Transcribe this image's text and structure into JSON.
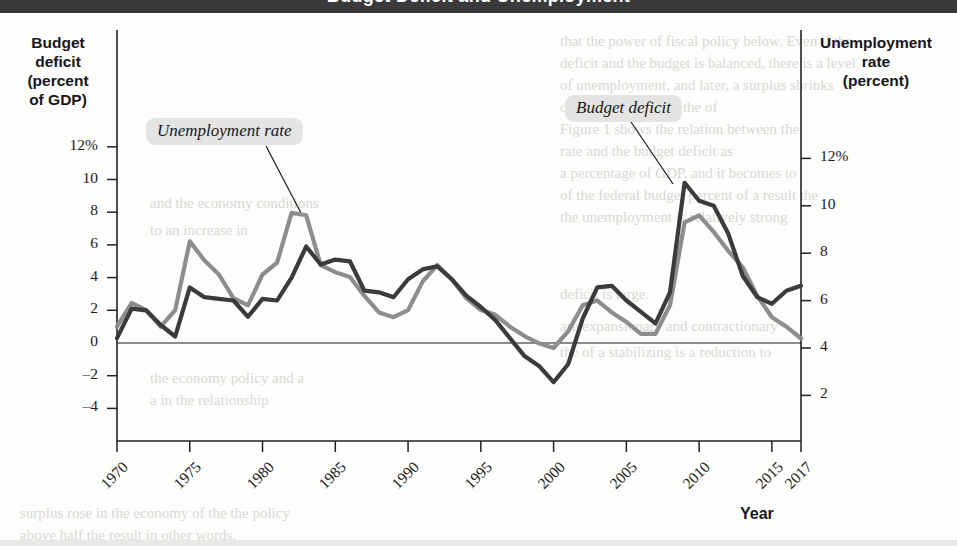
{
  "header": {
    "title": "Budget Deficit and Unemployment"
  },
  "axes": {
    "left_title_lines": [
      "Budget",
      "deficit",
      "(percent",
      "of GDP)"
    ],
    "right_title_lines": [
      "Unemployment",
      "rate",
      "(percent)"
    ],
    "x_title": "Year",
    "left_ticks": [
      "12%",
      "10",
      "8",
      "6",
      "4",
      "2",
      "0",
      "–2",
      "–4"
    ],
    "right_ticks": [
      "12%",
      "10",
      "8",
      "6",
      "4",
      "2"
    ],
    "x_ticks": [
      "1970",
      "1975",
      "1980",
      "1985",
      "1990",
      "1995",
      "2000",
      "2005",
      "2010",
      "2015",
      "2017"
    ]
  },
  "callouts": {
    "unemployment": "Unemployment rate",
    "budget_deficit": "Budget deficit"
  },
  "colors": {
    "unemployment_line": "#8d8d8d",
    "deficit_line": "#3b3b3d",
    "axis": "#222222",
    "callout_bg": "#e4e4e2",
    "header_bar": "#3a3a3c"
  },
  "ghost_text": [
    {
      "x": 560,
      "y": 33,
      "text": "that the power of fiscal policy below. Even if the"
    },
    {
      "x": 560,
      "y": 55,
      "text": "deficit and the budget is balanced, there is a level"
    },
    {
      "x": 560,
      "y": 77,
      "text": "of unemployment, and later, a surplus shrinks"
    },
    {
      "x": 560,
      "y": 99,
      "text": "of the resultant, and the of"
    },
    {
      "x": 560,
      "y": 121,
      "text": "Figure 1 shows the relation between the"
    },
    {
      "x": 560,
      "y": 143,
      "text": "rate and the budget deficit as"
    },
    {
      "x": 560,
      "y": 165,
      "text": "a percentage of GDP, and it becomes to"
    },
    {
      "x": 560,
      "y": 187,
      "text": "of the federal budget percent of a result the"
    },
    {
      "x": 560,
      "y": 209,
      "text": "the unemployment is relatively strong"
    },
    {
      "x": 150,
      "y": 195,
      "text": "and the economy conditions"
    },
    {
      "x": 150,
      "y": 222,
      "text": "to an increase in"
    },
    {
      "x": 560,
      "y": 286,
      "text": "deficit is large."
    },
    {
      "x": 560,
      "y": 318,
      "text": "are expansionary and contractionary"
    },
    {
      "x": 560,
      "y": 344,
      "text": "the of a stabilizing is a reduction to"
    },
    {
      "x": 150,
      "y": 370,
      "text": "the economy policy and a"
    },
    {
      "x": 150,
      "y": 392,
      "text": "a in the relationship"
    },
    {
      "x": 20,
      "y": 505,
      "text": "surplus rose in the economy of the the policy"
    },
    {
      "x": 20,
      "y": 527,
      "text": "above half the result in other words."
    }
  ],
  "chart_data": {
    "type": "line",
    "title": "Budget Deficit and Unemployment",
    "xlabel": "Year",
    "ylabel_left": "Budget deficit (percent of GDP)",
    "ylabel_right": "Unemployment rate (percent)",
    "xlim": [
      1970,
      2017
    ],
    "ylim_left": [
      -5,
      13
    ],
    "ylim_right": [
      1,
      13
    ],
    "grid": false,
    "legend_position": "inline-callouts",
    "x": [
      1970,
      1971,
      1972,
      1973,
      1974,
      1975,
      1976,
      1977,
      1978,
      1979,
      1980,
      1981,
      1982,
      1983,
      1984,
      1985,
      1986,
      1987,
      1988,
      1989,
      1990,
      1991,
      1992,
      1993,
      1994,
      1995,
      1996,
      1997,
      1998,
      1999,
      2000,
      2001,
      2002,
      2003,
      2004,
      2005,
      2006,
      2007,
      2008,
      2009,
      2010,
      2011,
      2012,
      2013,
      2014,
      2015,
      2016,
      2017
    ],
    "series": [
      {
        "name": "Budget deficit",
        "axis": "left",
        "units": "percent of GDP",
        "color": "#3b3b3d",
        "values": [
          0.3,
          2.1,
          2.0,
          1.1,
          0.4,
          3.4,
          2.8,
          2.7,
          2.6,
          1.6,
          2.7,
          2.6,
          4.0,
          5.9,
          4.8,
          5.1,
          5.0,
          3.2,
          3.1,
          2.8,
          3.9,
          4.5,
          4.7,
          3.9,
          2.9,
          2.2,
          1.4,
          0.3,
          -0.8,
          -1.4,
          -2.4,
          -1.3,
          1.5,
          3.4,
          3.5,
          2.6,
          1.9,
          1.2,
          3.1,
          9.8,
          8.7,
          8.4,
          6.7,
          4.1,
          2.8,
          2.4,
          3.2,
          3.5
        ]
      },
      {
        "name": "Unemployment rate",
        "axis": "right",
        "units": "percent",
        "color": "#8d8d8d",
        "values": [
          4.9,
          5.9,
          5.6,
          4.9,
          5.6,
          8.5,
          7.7,
          7.1,
          6.1,
          5.8,
          7.1,
          7.6,
          9.7,
          9.6,
          7.5,
          7.2,
          7.0,
          6.2,
          5.5,
          5.3,
          5.6,
          6.8,
          7.5,
          6.9,
          6.1,
          5.6,
          5.4,
          4.9,
          4.5,
          4.2,
          4.0,
          4.7,
          5.8,
          6.0,
          5.5,
          5.1,
          4.6,
          4.6,
          5.8,
          9.3,
          9.6,
          8.9,
          8.1,
          7.4,
          6.2,
          5.3,
          4.9,
          4.4
        ]
      }
    ]
  }
}
